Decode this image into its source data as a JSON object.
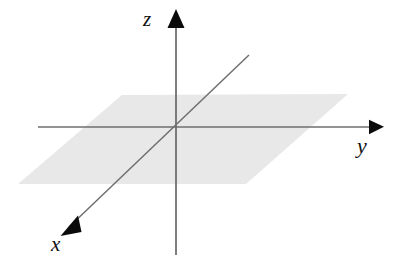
{
  "figure": {
    "background_color": "#ffffff",
    "width": 400,
    "height": 266
  },
  "chart_data": {
    "type": "diagram",
    "title": "",
    "xlabel": "",
    "ylabel": "",
    "grid": false,
    "legend": null,
    "origin": {
      "x": 176,
      "y": 127
    },
    "axes": [
      {
        "name": "z",
        "label": "z",
        "direction": "up",
        "line": {
          "x1": 176,
          "y1": 255,
          "x2": 176,
          "y2": 16
        },
        "arrow_tip": {
          "x": 176,
          "y": 9
        },
        "label_position": {
          "x": 150,
          "y": 20
        }
      },
      {
        "name": "y",
        "label": "y",
        "direction": "right",
        "line": {
          "x1": 38,
          "y1": 127,
          "x2": 374,
          "y2": 127
        },
        "arrow_tip": {
          "x": 384,
          "y": 127
        },
        "label_position": {
          "x": 364,
          "y": 150
        }
      },
      {
        "name": "x",
        "label": "x",
        "direction": "down-left",
        "line": {
          "x1": 249,
          "y1": 55,
          "x2": 69,
          "y2": 227
        },
        "arrow_tip": {
          "x": 60,
          "y": 236
        },
        "label_position": {
          "x": 58,
          "y": 247
        }
      }
    ],
    "plane": {
      "name": "xy-plane",
      "fill_color": "#e8e8e8",
      "points": [
        {
          "x": 122,
          "y": 95
        },
        {
          "x": 348,
          "y": 94
        },
        {
          "x": 246,
          "y": 184
        },
        {
          "x": 18,
          "y": 184
        }
      ]
    },
    "style": {
      "axis_line_color": "#6f6f6f",
      "axis_line_width": 1.6,
      "arrow_color": "#0b0b0b",
      "label_color": "#111111"
    }
  },
  "labels": {
    "z": "z",
    "y": "y",
    "x": "x"
  }
}
